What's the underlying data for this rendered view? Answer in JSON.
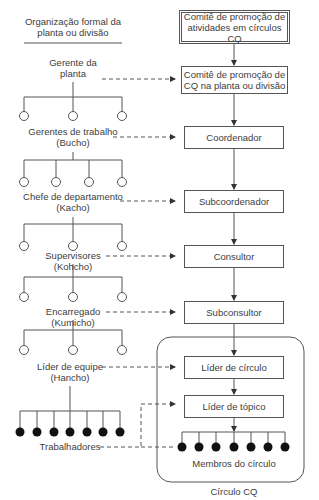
{
  "left_header": {
    "line1": "Organização formal da",
    "line2": "planta ou divisão"
  },
  "left_hierarchy": [
    {
      "line1": "Gerente da",
      "line2": "planta",
      "children": 3,
      "node": "open-circle"
    },
    {
      "line1": "Gerentes de trabalho",
      "line2": "(Bucho)",
      "children": 4,
      "node": "open-circle"
    },
    {
      "line1": "Chefe de departamento",
      "line2": "(Kacho)",
      "children": 3,
      "node": "open-circle"
    },
    {
      "line1": "Supervisores",
      "line2": "(Kohcho)",
      "children": 3,
      "node": "open-circle"
    },
    {
      "line1": "Encarregado",
      "line2": "(Kumicho)",
      "children": 3,
      "node": "open-circle"
    },
    {
      "line1": "Líder de equipe",
      "line2": "(Hancho)",
      "children": 7,
      "node": "filled-circle"
    },
    {
      "line1": "Trabalhadores",
      "line2": ""
    }
  ],
  "right_boxes": [
    {
      "line1": "Comitê de promoção de",
      "line2": "atividades em círculos CQ"
    },
    {
      "line1": "Comitê de promoção de",
      "line2": "CQ na planta ou divisão"
    },
    {
      "line1": "Coordenador",
      "line2": ""
    },
    {
      "line1": "Subcoordenador",
      "line2": ""
    },
    {
      "line1": "Consultor",
      "line2": ""
    },
    {
      "line1": "Subconsultor",
      "line2": ""
    },
    {
      "line1": "Líder de círculo",
      "line2": ""
    },
    {
      "line1": "Líder de tópico",
      "line2": ""
    }
  ],
  "circle_group": {
    "members_label": "Membros do círculo",
    "members_count": 7,
    "caption": "Círculo CQ"
  },
  "colors": {
    "line": "#555555",
    "text": "#3d3d3d",
    "node_fill": "#111111"
  }
}
